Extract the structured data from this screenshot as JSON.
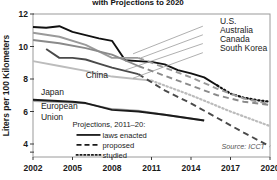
{
  "title": "with Projections to 2020",
  "source": "Source: ICCT",
  "axes": {
    "ylabel": "Liters per 100 Kilometers",
    "yticks": [
      "12",
      "10",
      "8",
      "6",
      "4"
    ],
    "xticks": [
      "2002",
      "2005",
      "2008",
      "2011",
      "2014",
      "2017",
      "2020"
    ]
  },
  "legend": {
    "title": "Projections, 2011–20:",
    "items": [
      {
        "label": "laws enacted",
        "style": "solid"
      },
      {
        "label": "proposed",
        "style": "dashed"
      },
      {
        "label": "studied",
        "style": "dotted"
      }
    ]
  },
  "series_labels": {
    "us": "U.S.",
    "australia": "Australia",
    "canada": "Canada",
    "south_korea": "South Korea",
    "china": "China",
    "japan": "Japan",
    "european_union": "European Union"
  },
  "colors": {
    "us": "#111111",
    "australia": "#9a9a9a",
    "canada": "#8a8a8a",
    "south_korea": "#bcbcbc",
    "china": "#4a4a4a",
    "japan": "#a8a8a8",
    "european_union": "#1a1a1a",
    "frame": "#9a9a9a",
    "text": "#1a1a1a"
  },
  "chart_data": {
    "type": "line",
    "title": "with Projections to 2020",
    "xlabel": "",
    "ylabel": "Liters per 100 Kilometers",
    "xlim": [
      2002,
      2020
    ],
    "ylim": [
      3.2,
      12
    ],
    "grid": false,
    "legend_position": "inside-bottom-left",
    "x": [
      2002,
      2003,
      2004,
      2005,
      2006,
      2007,
      2008,
      2009,
      2010,
      2011,
      2012,
      2013,
      2014,
      2015,
      2016,
      2017,
      2018,
      2019,
      2020
    ],
    "series": [
      {
        "name": "U.S.",
        "color": "#111111",
        "historical": {
          "x": [
            2002,
            2003,
            2004,
            2005,
            2006,
            2007,
            2008,
            2009,
            2010,
            2011,
            2012,
            2013,
            2014,
            2015,
            2016
          ],
          "y": [
            11.2,
            11.15,
            11.25,
            10.9,
            10.7,
            10.5,
            10.35,
            9.15,
            9.1,
            9.05,
            8.9,
            8.55,
            8.35,
            8.1,
            7.6
          ]
        },
        "projection": {
          "style": "studied",
          "x": [
            2016,
            2017,
            2018,
            2019,
            2020
          ],
          "y": [
            7.6,
            7.1,
            6.85,
            6.7,
            6.6
          ]
        }
      },
      {
        "name": "Australia",
        "color": "#9a9a9a",
        "historical": {
          "x": [
            2002,
            2004,
            2006,
            2008,
            2010
          ],
          "y": [
            10.85,
            10.6,
            10.1,
            9.3,
            9.3
          ]
        },
        "projection": {
          "style": "proposed",
          "x": [
            2010,
            2012,
            2014,
            2016,
            2018,
            2020
          ],
          "y": [
            9.3,
            8.7,
            8.1,
            7.4,
            6.8,
            6.45
          ]
        }
      },
      {
        "name": "Canada",
        "color": "#8a8a8a",
        "historical": {
          "x": [
            2002,
            2004,
            2006,
            2008,
            2010
          ],
          "y": [
            10.4,
            10.2,
            9.9,
            9.5,
            8.8
          ]
        },
        "projection": {
          "style": "proposed",
          "x": [
            2010,
            2012,
            2014,
            2016,
            2018,
            2020
          ],
          "y": [
            8.8,
            8.2,
            7.6,
            7.0,
            6.6,
            6.4
          ]
        }
      },
      {
        "name": "South Korea",
        "color": "#bcbcbc",
        "historical": {
          "x": [
            2002,
            2004,
            2006,
            2008,
            2011
          ],
          "y": [
            9.1,
            8.8,
            8.5,
            8.15,
            7.9
          ]
        },
        "projection": {
          "style": "studied",
          "x": [
            2011,
            2014,
            2017,
            2020
          ],
          "y": [
            7.9,
            7.0,
            6.0,
            5.1
          ]
        }
      },
      {
        "name": "China",
        "color": "#4a4a4a",
        "historical": {
          "x": [
            2003,
            2004,
            2005,
            2006,
            2007,
            2008,
            2010
          ],
          "y": [
            9.85,
            9.3,
            9.3,
            9.2,
            8.95,
            8.7,
            8.3
          ]
        },
        "projection": {
          "style": "proposed",
          "x": [
            2010,
            2012,
            2014,
            2016,
            2018,
            2020
          ],
          "y": [
            8.3,
            7.3,
            6.5,
            5.6,
            4.7,
            3.85
          ]
        }
      },
      {
        "name": "Japan",
        "color": "#a8a8a8",
        "historical": {
          "x": [
            2002,
            2005,
            2006,
            2008,
            2010,
            2012,
            2015
          ],
          "y": [
            6.65,
            6.55,
            6.5,
            6.15,
            6.05,
            5.8,
            5.45
          ]
        },
        "projection": {
          "style": "none",
          "x": [],
          "y": []
        }
      },
      {
        "name": "European Union",
        "color": "#1a1a1a",
        "historical": {
          "x": [
            2002,
            2005,
            2006,
            2008,
            2010,
            2012,
            2015
          ],
          "y": [
            6.72,
            6.6,
            6.52,
            6.1,
            6.0,
            5.8,
            5.45
          ]
        },
        "projection": {
          "style": "none",
          "x": [],
          "y": []
        }
      }
    ],
    "annotations": [
      {
        "text": "U.S.",
        "x": 2016.2,
        "y": 11.4
      },
      {
        "text": "Australia",
        "x": 2016.2,
        "y": 10.85
      },
      {
        "text": "Canada",
        "x": 2016.2,
        "y": 10.3
      },
      {
        "text": "South Korea",
        "x": 2016.2,
        "y": 9.75
      },
      {
        "text": "China",
        "x": 2006.0,
        "y": 8.05
      },
      {
        "text": "Japan",
        "x": 2002.6,
        "y": 7.0
      },
      {
        "text": "European Union",
        "x": 2002.6,
        "y": 6.15
      }
    ]
  }
}
